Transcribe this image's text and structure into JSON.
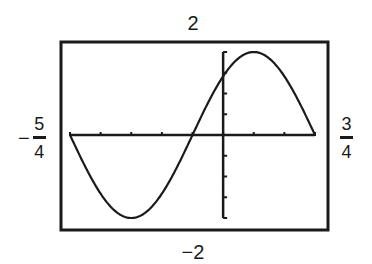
{
  "chart_data": {
    "type": "line",
    "title": "",
    "function": "y = 2 sin(π(x + 1/4))",
    "window": {
      "xmin": -1.25,
      "xmax": 0.75,
      "ymin": -2,
      "ymax": 2,
      "xscl": 0.25,
      "yscl": 0.5
    },
    "labels": {
      "ymax": "2",
      "ymin": "−2",
      "xmin": {
        "sign": "−",
        "numerator": "5",
        "denominator": "4"
      },
      "xmax": {
        "sign": "",
        "numerator": "3",
        "denominator": "4"
      }
    },
    "series": [
      {
        "name": "y = 2 sin(π(x + 1/4))",
        "amplitude": 2,
        "period": 2,
        "phase_shift": -0.25,
        "x": [
          -1.25,
          -1.0,
          -0.75,
          -0.5,
          -0.25,
          0.0,
          0.25,
          0.5,
          0.75
        ],
        "values": [
          0,
          -1.414,
          -2,
          -1.414,
          0,
          1.414,
          2,
          1.414,
          0
        ]
      }
    ],
    "key_points": {
      "zeros": [
        -1.25,
        -0.25,
        0.75
      ],
      "maximum": {
        "x": 0.25,
        "y": 2
      },
      "minimum": {
        "x": -0.75,
        "y": -2
      },
      "y_intercept": 1.414
    },
    "xlabel": "",
    "ylabel": "",
    "xlim": [
      -1.25,
      0.75
    ],
    "ylim": [
      -2,
      2
    ],
    "grid": false,
    "legend": "none"
  },
  "colors": {
    "ink": "#1a1a1a",
    "background": "#ffffff"
  }
}
